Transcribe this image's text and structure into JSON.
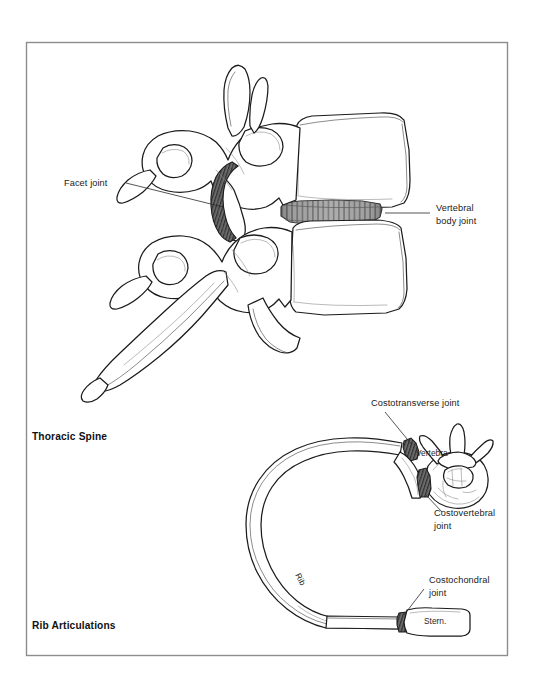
{
  "figure": {
    "kind": "anatomical-illustration",
    "background_color": "#ffffff",
    "frame_color": "#8d8d8d",
    "ink_color": "#1b1b1b",
    "panels": [
      {
        "id": "thoracic-spine",
        "title": "Thoracic Spine",
        "title_position": {
          "x": 32,
          "y": 440
        }
      },
      {
        "id": "rib-articulations",
        "title": "Rib Articulations",
        "title_position": {
          "x": 32,
          "y": 629
        }
      }
    ]
  },
  "labels": {
    "facet_joint": {
      "text": "Facet joint",
      "x": 64,
      "y": 186,
      "anchor": "start"
    },
    "vertebral_body_joint": {
      "line1": "Vertebral",
      "line2": "body joint",
      "x": 436,
      "y": 215
    },
    "costotransverse_joint": {
      "text": "Costotransverse joint",
      "x": 371,
      "y": 406,
      "anchor": "start"
    },
    "vertebra": {
      "text": "Vertebra",
      "x": 416,
      "y": 456
    },
    "costovertebral_joint": {
      "line1": "Costovertebral",
      "line2": "joint",
      "x": 434,
      "y": 516
    },
    "costochondral_joint": {
      "line1": "Costochondral",
      "line2": "joint",
      "x": 429,
      "y": 583
    },
    "rib": {
      "text": "Rib",
      "x": 295,
      "y": 575,
      "rotation": 62
    },
    "sternum": {
      "text": "Stern.",
      "x": 443,
      "y": 621
    }
  },
  "structures": {
    "disc_color_dark": "#6f6f6f",
    "disc_color_mid": "#9a9a9a",
    "disc_color_light": "#c4c4c4",
    "facet_cartilage_color": "#5e5e5e",
    "bone_fill": "#ffffff"
  }
}
